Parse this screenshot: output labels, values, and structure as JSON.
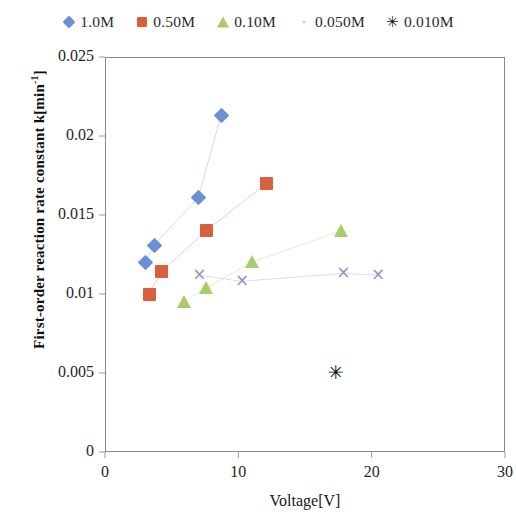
{
  "chart_data": {
    "type": "scatter",
    "title": "",
    "xlabel": "Voltage[V]",
    "ylabel": "First-order reaction rate constant k[min-1]",
    "ylabel_main": "First-order  reaction  rate  constant  k[min",
    "ylabel_sup": "-1",
    "ylabel_tail": "]",
    "xlim": [
      0,
      30
    ],
    "ylim": [
      0,
      0.025
    ],
    "xticks": [
      "0",
      "10",
      "20",
      "30"
    ],
    "xtick_values": [
      0,
      10,
      20,
      30
    ],
    "yticks": [
      "0",
      "0.005",
      "0.01",
      "0.015",
      "0.02",
      "0.025"
    ],
    "ytick_values": [
      0,
      0.005,
      0.01,
      0.015,
      0.02,
      0.025
    ],
    "grid": false,
    "legend_position": "top",
    "series": [
      {
        "name": "1.0M",
        "marker": "diamond",
        "color": "#6c8fd4",
        "connected": true,
        "x": [
          3.0,
          3.7,
          7.0,
          8.7
        ],
        "y": [
          0.012,
          0.0131,
          0.0161,
          0.0213
        ]
      },
      {
        "name": "0.50M",
        "marker": "square",
        "color": "#d9603f",
        "connected": true,
        "x": [
          3.3,
          4.2,
          7.6,
          12.1
        ],
        "y": [
          0.01,
          0.0114,
          0.014,
          0.017
        ]
      },
      {
        "name": "0.10M",
        "marker": "triangle",
        "color": "#a9cc6b",
        "connected": true,
        "x": [
          5.9,
          7.6,
          11.0,
          17.7
        ],
        "y": [
          0.0095,
          0.0104,
          0.012,
          0.014
        ]
      },
      {
        "name": "0.050M",
        "marker": "x",
        "color": "#9d8fc4",
        "connected": true,
        "x": [
          7.0,
          10.2,
          17.8,
          20.4
        ],
        "y": [
          0.0112,
          0.0108,
          0.0113,
          0.0112
        ]
      },
      {
        "name": "0.010M",
        "marker": "asterisk",
        "color": "#0b0b0b",
        "connected": false,
        "x": [
          17.3
        ],
        "y": [
          0.005
        ]
      }
    ]
  },
  "legend": {
    "items": [
      {
        "label": "1.0M",
        "marker": "diamond-marker-icon",
        "color": "#6c8fd4"
      },
      {
        "label": "0.50M",
        "marker": "square-marker-icon",
        "color": "#d9603f"
      },
      {
        "label": "0.10M",
        "marker": "triangle-marker-icon",
        "color": "#a9cc6b"
      },
      {
        "label": "0.050M",
        "marker": "dot-marker-icon",
        "color": "#b7aecd"
      },
      {
        "label": "0.010M",
        "marker": "asterisk-marker-icon",
        "color": "#111111"
      }
    ]
  },
  "glyphs": {
    "x_mark": "×",
    "asterisk": "✳",
    "legend_asterisk": "✳"
  }
}
